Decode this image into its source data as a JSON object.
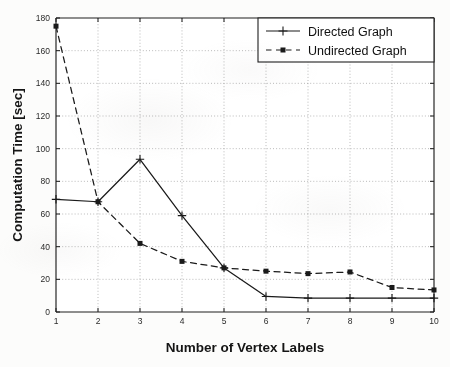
{
  "figure": {
    "kind": "line-chart",
    "background": "#fcfcfb",
    "ink": "#1a1a1a"
  },
  "chart_data": {
    "type": "line",
    "title": "",
    "xlabel": "Number of Vertex Labels",
    "ylabel": "Computation Time [sec]",
    "x": [
      1,
      2,
      3,
      4,
      5,
      6,
      7,
      8,
      9,
      10
    ],
    "xlim": [
      1,
      10
    ],
    "ylim": [
      0,
      180
    ],
    "xticks": [
      1,
      2,
      3,
      4,
      5,
      6,
      7,
      8,
      9,
      10
    ],
    "yticks": [
      0,
      20,
      40,
      60,
      80,
      100,
      120,
      140,
      160,
      180
    ],
    "xticklabels": [
      "1",
      "2",
      "3",
      "4",
      "5",
      "6",
      "7",
      "8",
      "9",
      "10"
    ],
    "yticklabels": [
      "0",
      "20",
      "40",
      "60",
      "80",
      "100",
      "120",
      "140",
      "160",
      "180"
    ],
    "grid": true,
    "grid_style": "dotted",
    "legend_position": "top-right",
    "series": [
      {
        "name": "Directed Graph",
        "linestyle": "solid",
        "marker": "plus",
        "color": "#1a1a1a",
        "values": [
          69,
          67.5,
          93.5,
          59,
          27,
          9.5,
          8.5,
          8.5,
          8.5,
          8.5
        ]
      },
      {
        "name": "Undirected Graph",
        "linestyle": "dashed",
        "marker": "square",
        "color": "#1a1a1a",
        "values": [
          175,
          67.5,
          42,
          31,
          27,
          25,
          23.5,
          24.5,
          15,
          13.5
        ]
      }
    ]
  },
  "legend": {
    "entries": [
      {
        "label": "Directed Graph"
      },
      {
        "label": "Undirected Graph"
      }
    ]
  }
}
